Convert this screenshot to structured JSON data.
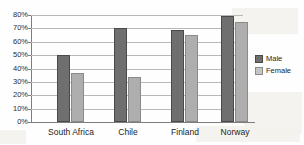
{
  "chart_data": {
    "type": "bar",
    "title": "",
    "xlabel": "",
    "ylabel": "",
    "categories": [
      "South Africa",
      "Chile",
      "Finland",
      "Norway"
    ],
    "series": [
      {
        "name": "Male",
        "color": "#6f6f6f",
        "values": [
          50,
          70,
          69,
          79
        ]
      },
      {
        "name": "Female",
        "color": "#aeaeae",
        "values": [
          37,
          34,
          65,
          75
        ]
      }
    ],
    "ylim": [
      0,
      80
    ],
    "ytick_labels": [
      "80%",
      "70%",
      "60%",
      "50%",
      "40%",
      "30%",
      "20%",
      "10%",
      "0%"
    ],
    "ytick_values": [
      80,
      70,
      60,
      50,
      40,
      30,
      20,
      10,
      0
    ],
    "grid": true,
    "legend_position": "right"
  },
  "legend": {
    "entries": [
      {
        "label": "Male"
      },
      {
        "label": "Female"
      }
    ]
  }
}
